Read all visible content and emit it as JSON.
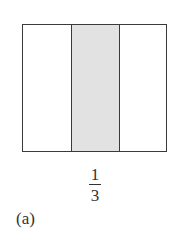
{
  "figure": {
    "caption": "(a)",
    "parts_total": 3,
    "shaded_part_index": 2,
    "fraction": {
      "numerator": "1",
      "denominator": "3"
    },
    "colors": {
      "border": "#3a3a3a",
      "shaded": "#e2e2e2",
      "unshaded": "#ffffff",
      "text": "#333333"
    }
  }
}
